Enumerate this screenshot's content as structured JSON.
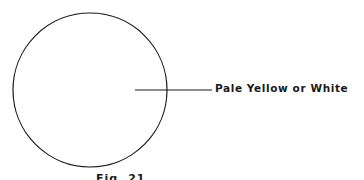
{
  "diagram": {
    "shape": "circle",
    "callout_label": "Pale Yellow or White",
    "caption": "Fig. 21"
  },
  "colors": {
    "stroke": "#1a1a1a",
    "background": "#ffffff"
  }
}
